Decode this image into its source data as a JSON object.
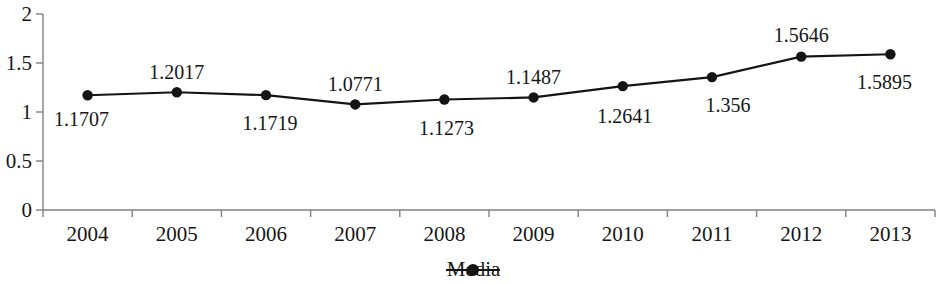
{
  "chart_data": {
    "type": "line",
    "title": "",
    "xlabel": "",
    "ylabel": "",
    "categories": [
      "2004",
      "2005",
      "2006",
      "2007",
      "2008",
      "2009",
      "2010",
      "2011",
      "2012",
      "2013"
    ],
    "series": [
      {
        "name": "Media",
        "values": [
          1.1707,
          1.2017,
          1.1719,
          1.0771,
          1.1273,
          1.1487,
          1.2641,
          1.356,
          1.5646,
          1.5895
        ],
        "point_labels": [
          "1.1707",
          "1.2017",
          "1.1719",
          "1.0771",
          "1.1273",
          "1.1487",
          "1.2641",
          "1.356",
          "1.5646",
          "1.5895"
        ],
        "color": "#141414",
        "marker": "circle"
      }
    ],
    "ylim": [
      0,
      2
    ],
    "y_ticks": [
      0,
      0.5,
      1,
      1.5,
      2
    ],
    "y_tick_labels": [
      "0",
      "0.5",
      "1",
      "1.5",
      "2"
    ],
    "grid": false,
    "legend": {
      "position": "bottom",
      "entries": [
        "Media"
      ]
    },
    "axis_color": "#808080",
    "background": "#ffffff"
  },
  "legend": {
    "series_label": "Media"
  }
}
